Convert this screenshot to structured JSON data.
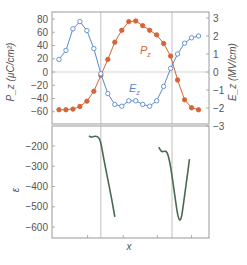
{
  "colors": {
    "pz": "#d4643a",
    "ez": "#5a8ac8",
    "energy": "#4a6a50",
    "frame": "#9a9a9a",
    "guide": "#b0b0b0"
  },
  "chart_data": [
    {
      "type": "line",
      "panel": "top",
      "title": "",
      "xlabel": "",
      "ylabel_left": "P_z (μC/cm²)",
      "ylabel_right": "E_z (MV/cm)",
      "ylim_left": [
        -80,
        90
      ],
      "ylim_right": [
        -3,
        3
      ],
      "yticks_left": [
        80,
        60,
        40,
        20,
        0,
        -20,
        -40,
        -60
      ],
      "yticks_right": [
        3,
        2,
        1,
        0,
        -1,
        -2,
        -3
      ],
      "ytick_labels_left": [
        "80",
        "60",
        "40",
        "20",
        "0",
        "−20",
        "−40",
        "−60"
      ],
      "ytick_labels_right": [
        "3",
        "2",
        "1",
        "0",
        "−1",
        "−2",
        "−3"
      ],
      "x": [
        0,
        1,
        2,
        3,
        4,
        5,
        6,
        7,
        8,
        9,
        10,
        11,
        12,
        13,
        14,
        15,
        16,
        17,
        18,
        19,
        20
      ],
      "xlim": [
        -1,
        21.5
      ],
      "guides_x": [
        6,
        16.2
      ],
      "series": [
        {
          "name": "P_z",
          "label": "P",
          "label_sub": "z",
          "axis": "left",
          "marker": "filled-circle",
          "values": [
            -57,
            -57,
            -56,
            -52,
            -44,
            -29,
            -5,
            19,
            45,
            63,
            76,
            77,
            70,
            63,
            56,
            43,
            24,
            -12,
            -42,
            -54,
            -57
          ]
        },
        {
          "name": "E_z",
          "label": "E",
          "label_sub": "z",
          "axis": "right",
          "marker": "open-circle",
          "values": [
            0.7,
            1.2,
            2.4,
            2.8,
            2.3,
            1.3,
            -0.1,
            -1.2,
            -1.8,
            -1.9,
            -1.6,
            -1.6,
            -1.8,
            -1.9,
            -1.6,
            -0.8,
            0.2,
            1.0,
            1.6,
            1.9,
            2.0
          ]
        }
      ]
    },
    {
      "type": "line",
      "panel": "bottom",
      "title": "",
      "xlabel": "x",
      "ylabel": "ε",
      "ylim": [
        -640,
        -100
      ],
      "yticks": [
        -200,
        -300,
        -400,
        -500,
        -600
      ],
      "ytick_labels": [
        "−200",
        "−300",
        "−400",
        "−500",
        "−600"
      ],
      "xlim": [
        -1,
        21.5
      ],
      "xticks": [
        4.1,
        9.2,
        14.1,
        19.0
      ],
      "guides_x": [
        6,
        16.2
      ],
      "series": [
        {
          "name": "segment-1",
          "x": [
            4.3,
            4.6,
            5.0,
            5.4,
            5.8,
            6.1,
            6.4,
            6.8,
            7.2,
            7.6,
            8.0
          ],
          "values": [
            -150,
            -158,
            -152,
            -152,
            -160,
            -200,
            -260,
            -330,
            -400,
            -470,
            -550
          ]
        },
        {
          "name": "segment-2",
          "x": [
            14.3,
            14.7,
            15.1,
            15.5,
            15.9,
            16.3,
            16.7,
            17.1,
            17.5,
            17.9,
            18.3,
            18.7
          ],
          "values": [
            -205,
            -230,
            -225,
            -228,
            -280,
            -370,
            -470,
            -560,
            -570,
            -470,
            -370,
            -265
          ]
        }
      ]
    }
  ]
}
